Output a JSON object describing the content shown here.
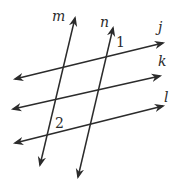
{
  "diagram": {
    "type": "parallel-lines-transversals",
    "line_color": "#2b2b2b",
    "background": "#ffffff",
    "lines": [
      {
        "name": "m",
        "label": "m",
        "x1": 75,
        "y1": 18,
        "x2": 40,
        "y2": 165,
        "label_x": 52,
        "label_y": 21
      },
      {
        "name": "n",
        "label": "n",
        "x1": 113,
        "y1": 28,
        "x2": 78,
        "y2": 177,
        "label_x": 100,
        "label_y": 27
      },
      {
        "name": "j",
        "label": "j",
        "x1": 15,
        "y1": 79,
        "x2": 163,
        "y2": 43,
        "label_x": 158,
        "label_y": 32
      },
      {
        "name": "k",
        "label": "k",
        "x1": 13,
        "y1": 109,
        "x2": 160,
        "y2": 76,
        "label_x": 158,
        "label_y": 66
      },
      {
        "name": "l",
        "label": "l",
        "x1": 15,
        "y1": 143,
        "x2": 163,
        "y2": 106,
        "label_x": 164,
        "label_y": 102
      }
    ],
    "angles": [
      {
        "label": "1",
        "x": 116,
        "y": 47
      },
      {
        "label": "2",
        "x": 55,
        "y": 128
      }
    ]
  }
}
